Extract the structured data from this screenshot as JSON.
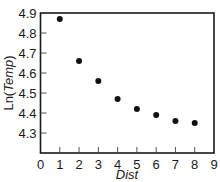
{
  "chart_data": {
    "type": "scatter",
    "title": "",
    "xlabel": "Dist",
    "ylabel": {
      "prefix": "Ln(",
      "italic": "Temp",
      "suffix": ")"
    },
    "xlim": [
      0,
      9
    ],
    "ylim": [
      4.2,
      4.9
    ],
    "xticks": [
      "0",
      "1",
      "2",
      "3",
      "4",
      "5",
      "6",
      "7",
      "8",
      "9"
    ],
    "yticks": [
      "4.3",
      "4.4",
      "4.5",
      "4.6",
      "4.7",
      "4.8",
      "4.9"
    ],
    "grid": false,
    "legend": null,
    "series": [
      {
        "name": "Ln(Temp)",
        "color": "#111111",
        "x": [
          1,
          2,
          3,
          4,
          5,
          6,
          7,
          8
        ],
        "y": [
          4.87,
          4.66,
          4.56,
          4.47,
          4.42,
          4.39,
          4.36,
          4.35
        ]
      }
    ]
  }
}
